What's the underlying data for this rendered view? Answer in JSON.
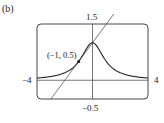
{
  "panel_label": "(b)",
  "chart_data": {
    "type": "line",
    "title": "",
    "xlabel": "",
    "ylabel": "",
    "xlim": [
      -4,
      4
    ],
    "ylim": [
      -0.5,
      1.5
    ],
    "grid": false,
    "tick_labels": {
      "xmin": "−4",
      "xmax": "4",
      "ymin": "−0.5",
      "ymax": "1.5"
    },
    "series": [
      {
        "name": "f(x) = 1/(1+x^2)",
        "x": [
          -4,
          -3,
          -2,
          -1.5,
          -1,
          -0.5,
          0,
          0.5,
          1,
          1.5,
          2,
          3,
          4
        ],
        "values": [
          0.059,
          0.1,
          0.2,
          0.308,
          0.5,
          0.8,
          1.0,
          0.8,
          0.5,
          0.308,
          0.2,
          0.1,
          0.059
        ]
      },
      {
        "name": "tangent line at (-1, 0.5): y = 0.5x + 1",
        "x": [
          -3,
          1
        ],
        "values": [
          -0.5,
          1.5
        ]
      }
    ],
    "annotations": [
      {
        "text": "(−1, 0.5)",
        "x": -1,
        "y": 0.5,
        "marker": "dot"
      }
    ]
  }
}
